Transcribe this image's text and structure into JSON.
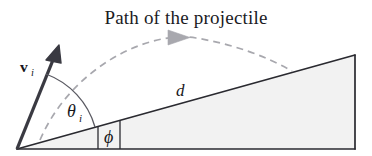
{
  "figure": {
    "title": "Path of the projectile",
    "width": 372,
    "height": 156,
    "background_color": "#ffffff"
  },
  "labels": {
    "initial_velocity_symbol": "v",
    "initial_velocity_subscript": "i",
    "launch_angle_symbol": "θ",
    "launch_angle_subscript": "i",
    "incline_angle_symbol": "ϕ",
    "distance_symbol": "d"
  },
  "colors": {
    "ink": "#17171b",
    "incline_fill": "#f2f2f2",
    "incline_stroke": "#2a2a30",
    "trajectory_dash": "#a8a8ae",
    "arrow_vector": "#3a3a42",
    "arc_stroke": "#5a5a62",
    "title_text": "#1b1b1f"
  },
  "geometry": {
    "origin": {
      "x": 17,
      "y": 149
    },
    "incline_apex": {
      "x": 355,
      "y": 55
    },
    "incline_base_right": {
      "x": 355,
      "y": 149
    },
    "velocity_arrow_tip": {
      "x": 59,
      "y": 47
    },
    "incline_angle_degrees": 16,
    "launch_angle_degrees": 68,
    "trajectory_arrow_position": {
      "x": 182,
      "y": 37
    },
    "trajectory_landing": {
      "x": 292,
      "y": 71
    }
  },
  "elements": {
    "title_label": "Path of the projectile",
    "trajectory_name": "projectile-path",
    "incline_name": "inclined-plane",
    "vector_name": "initial-velocity-vector"
  }
}
